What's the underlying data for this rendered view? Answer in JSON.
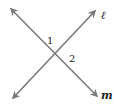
{
  "diagram": {
    "type": "intersecting-lines",
    "line_color": "#7a7a7a",
    "label_color": "#222222",
    "lines": [
      {
        "name": "ℓ",
        "from": [
          13,
          98
        ],
        "to": [
          95,
          11
        ]
      },
      {
        "name": "m",
        "from": [
          11,
          9
        ],
        "to": [
          97,
          96
        ]
      }
    ],
    "angle_labels": [
      {
        "text": "1",
        "x": 47,
        "y": 44
      },
      {
        "text": "2",
        "x": 69,
        "y": 62
      }
    ],
    "line_labels": [
      {
        "text": "ℓ",
        "x": 101,
        "y": 19
      },
      {
        "text": "m",
        "x": 101,
        "y": 99
      }
    ]
  }
}
